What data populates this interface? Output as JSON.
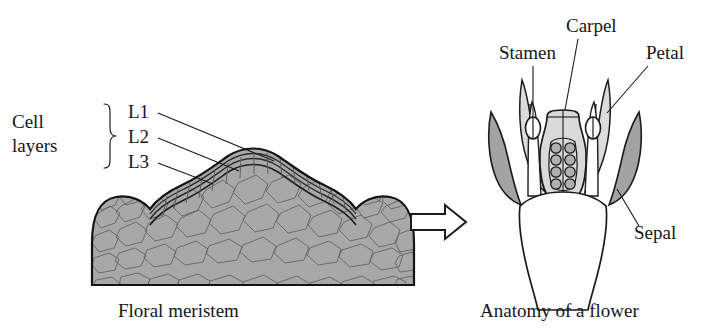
{
  "figure": {
    "background_color": "#ffffff",
    "ink_color": "#16161a"
  },
  "left_panel": {
    "caption": "Floral meristem",
    "group_label_line1": "Cell",
    "group_label_line2": "layers",
    "brace_icon": "curly-brace-icon",
    "layers": [
      {
        "id": "L1",
        "label": "L1"
      },
      {
        "id": "L2",
        "label": "L2"
      },
      {
        "id": "L3",
        "label": "L3"
      }
    ],
    "tissue_fill": "#a8a8a8",
    "cell_fill": "#b4b4b4",
    "cell_stroke": "#6a6a6a",
    "outline_stroke": "#141414"
  },
  "transition": {
    "arrow_icon": "block-arrow-right-icon",
    "arrow_fill": "#ffffff",
    "arrow_stroke": "#1b1b1b"
  },
  "right_panel": {
    "caption": "Anatomy of a flower",
    "parts": [
      {
        "id": "stamen",
        "label": "Stamen",
        "fill": "#ffffff"
      },
      {
        "id": "carpel",
        "label": "Carpel",
        "fill": "#d9d9d9"
      },
      {
        "id": "petal",
        "label": "Petal",
        "fill": "#dcdcdc"
      },
      {
        "id": "sepal",
        "label": "Sepal",
        "fill": "#a3a3a3"
      }
    ],
    "ovule_fill": "#b0b0b0",
    "ovule_rows": 4,
    "ovule_columns": 2,
    "anther_count": 2,
    "petal_count": 2,
    "sepal_count": 2,
    "receptacle_fill": "#ffffff"
  }
}
